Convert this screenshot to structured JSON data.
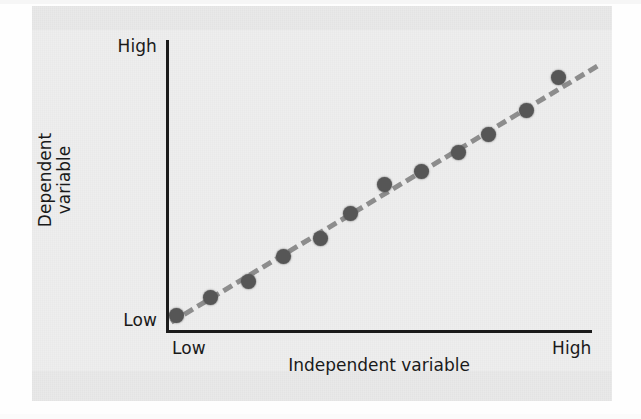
{
  "figure": {
    "kind": "scatter-with-trend-line",
    "panel_background": "#e9e9e9",
    "page_background": "#fefefe"
  },
  "axes": {
    "y_title_line1": "Dependent",
    "y_title_line2": "variable",
    "y_high_label": "High",
    "y_low_label": "Low",
    "x_title": "Independent variable",
    "x_low_label": "Low",
    "x_high_label": "High",
    "axis_color": "#1c1c1c"
  },
  "chart_data": {
    "type": "scatter",
    "title": "",
    "xlabel": "Independent variable",
    "ylabel": "Dependent variable",
    "xlim": [
      0,
      100
    ],
    "ylim": [
      0,
      100
    ],
    "xtick_labels": [
      "Low",
      "High"
    ],
    "ytick_labels": [
      "Low",
      "High"
    ],
    "grid": false,
    "legend": "none",
    "marker_color": "#565656",
    "marker_size_px": 15,
    "trendline": {
      "style": "dashed",
      "color": "#8d8d8d",
      "width_px": 5,
      "x_start": 2,
      "y_start": 3,
      "x_end": 101,
      "y_end": 92,
      "description": "positive linear correlation"
    },
    "points": [
      {
        "x": 2,
        "y": 5
      },
      {
        "x": 10,
        "y": 11
      },
      {
        "x": 19,
        "y": 17
      },
      {
        "x": 27,
        "y": 25
      },
      {
        "x": 36,
        "y": 31
      },
      {
        "x": 43,
        "y": 40
      },
      {
        "x": 51,
        "y": 50
      },
      {
        "x": 60,
        "y": 55
      },
      {
        "x": 68,
        "y": 61
      },
      {
        "x": 76,
        "y": 67
      },
      {
        "x": 84,
        "y": 76
      },
      {
        "x": 92,
        "y": 87
      }
    ],
    "pixel_points": [
      {
        "px": 176,
        "py": 315
      },
      {
        "px": 210,
        "py": 297
      },
      {
        "px": 248,
        "py": 281
      },
      {
        "px": 283,
        "py": 256
      },
      {
        "px": 320,
        "py": 238
      },
      {
        "px": 350,
        "py": 213
      },
      {
        "px": 384,
        "py": 184
      },
      {
        "px": 421,
        "py": 171
      },
      {
        "px": 458,
        "py": 152
      },
      {
        "px": 488,
        "py": 134
      },
      {
        "px": 526,
        "py": 110
      },
      {
        "px": 558,
        "py": 77
      }
    ],
    "trendline_pixels": {
      "x1": 170,
      "y1": 320,
      "x2": 596,
      "y2": 64
    }
  }
}
